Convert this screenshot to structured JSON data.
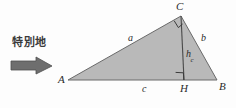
{
  "figure": {
    "kind": "geometry-diagram",
    "title_text": "",
    "background_color": "#fdfdfd",
    "fill_color": "#b9b9b9",
    "stroke_color": "#555555",
    "label_color": "#2b2b2b",
    "arrow_color": "#6e6e6e",
    "annotation": {
      "text": "特別地",
      "arrow_icon": "right-arrow-icon"
    },
    "vertices": [
      {
        "name": "A",
        "label": "A",
        "x": 68,
        "y": 80
      },
      {
        "name": "B",
        "label": "B",
        "x": 217,
        "y": 80
      },
      {
        "name": "C",
        "label": "C",
        "x": 181,
        "y": 16
      },
      {
        "name": "H",
        "label": "H",
        "x": 184,
        "y": 80
      }
    ],
    "vertex_labels": [
      {
        "name": "A",
        "text": "A",
        "x": 58,
        "y": 74
      },
      {
        "name": "B",
        "text": "B",
        "x": 219,
        "y": 81
      },
      {
        "name": "C",
        "text": "C",
        "x": 176,
        "y": 1
      },
      {
        "name": "H",
        "text": "H",
        "x": 180,
        "y": 83
      }
    ],
    "side_labels": [
      {
        "name": "side-a",
        "text": "a",
        "sub": "",
        "x": 128,
        "y": 33
      },
      {
        "name": "side-b",
        "text": "b",
        "sub": "",
        "x": 201,
        "y": 33
      },
      {
        "name": "side-c",
        "text": "c",
        "sub": "",
        "x": 142,
        "y": 84
      },
      {
        "name": "altitude-h",
        "text": "h",
        "sub": "c",
        "x": 186,
        "y": 49
      }
    ],
    "right_angles": [
      {
        "name": "right-angle-at-C",
        "at": "C"
      },
      {
        "name": "right-angle-at-H",
        "at": "H"
      }
    ]
  }
}
